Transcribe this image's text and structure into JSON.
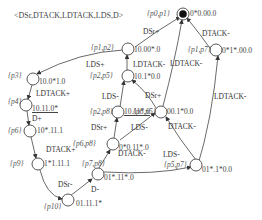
{
  "title": "<DSr,DTACK,LDTACK,LDS,D>",
  "nodes": [
    {
      "id": "p0p1",
      "name": "{p0,p1}",
      "code": "0*0.00.0",
      "initial": true
    },
    {
      "id": "p1p2",
      "name": "{p1,p2}",
      "code": "10.00*.0"
    },
    {
      "id": "p1p7",
      "name": "{p1,p7}",
      "code": "0*1*.00.0"
    },
    {
      "id": "p3",
      "name": "{p3}",
      "code": "10.0*1.0"
    },
    {
      "id": "p2p5",
      "name": "{p2,p5}",
      "code": "10.1*0.0"
    },
    {
      "id": "p4",
      "name": "{p4}",
      "code": "10.11.0*",
      "underline": true
    },
    {
      "id": "p2p8",
      "name": "{p2,p8}",
      "code": "10.11*.0",
      "underline": true
    },
    {
      "id": "p6p5",
      "name": "{p6,p5}",
      "code": "00.1*0.0"
    },
    {
      "id": "p6",
      "name": "{p6}",
      "code": "10*.11.1"
    },
    {
      "id": "p6p8",
      "name": "{p6,p8}",
      "code": "0*0.11*.0"
    },
    {
      "id": "p5p7",
      "name": "{p5,p7}",
      "code": "01*.1*0.0"
    },
    {
      "id": "p9",
      "name": "{p9}",
      "code": "1*1.11.1"
    },
    {
      "id": "p7p8",
      "name": "{p7,p8}",
      "code": "01*.11*.0"
    },
    {
      "id": "p10",
      "name": "{p10}",
      "code": "01.11.1*"
    }
  ],
  "edges": [
    {
      "from": "p1p2",
      "to": "p0p1",
      "label": "DSr+"
    },
    {
      "from": "p1p7",
      "to": "p0p1",
      "label": "DTACK-"
    },
    {
      "from": "p2p5",
      "to": "p0p1",
      "label": "LDTACK-"
    },
    {
      "from": "p1p2",
      "to": "p3",
      "label": "LDS+"
    },
    {
      "from": "p2p5",
      "to": "p1p2",
      "label": "LDTACK-"
    },
    {
      "from": "p5p7",
      "to": "p1p7",
      "label": "LDTACK-"
    },
    {
      "from": "p3",
      "to": "p4",
      "label": "LDTACK+"
    },
    {
      "from": "p2p8",
      "to": "p2p5",
      "label": "LDS-"
    },
    {
      "from": "p6p5",
      "to": "p2p5",
      "label": "DSr+"
    },
    {
      "from": "p4",
      "to": "p6",
      "label": "D+"
    },
    {
      "from": "p6p8",
      "to": "p2p8",
      "label": "DSr+"
    },
    {
      "from": "p6p8",
      "to": "p6p5",
      "label": "LDS-"
    },
    {
      "from": "p5p7",
      "to": "p6p5",
      "label": "DTACK-"
    },
    {
      "from": "p6",
      "to": "p9",
      "label": "DTACK+"
    },
    {
      "from": "p7p8",
      "to": "p6p8",
      "label": "DTACK-"
    },
    {
      "from": "p7p8",
      "to": "p5p7",
      "label": "LDS-"
    },
    {
      "from": "p9",
      "to": "p10",
      "label": "DSr-"
    },
    {
      "from": "p10",
      "to": "p7p8",
      "label": "D-"
    }
  ]
}
